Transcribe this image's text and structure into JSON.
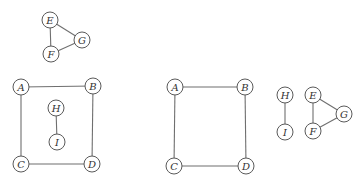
{
  "graphs": [
    {
      "id": "top-triangle",
      "nodes": [
        {
          "label": "E",
          "x": 50,
          "y": 20
        },
        {
          "label": "F",
          "x": 51,
          "y": 54
        },
        {
          "label": "G",
          "x": 82,
          "y": 40
        }
      ],
      "edges": [
        [
          "E",
          "F"
        ],
        [
          "E",
          "G"
        ],
        [
          "F",
          "G"
        ]
      ]
    },
    {
      "id": "left-square-with-HI",
      "nodes": [
        {
          "label": "A",
          "x": 21,
          "y": 87
        },
        {
          "label": "B",
          "x": 93,
          "y": 86
        },
        {
          "label": "C",
          "x": 21,
          "y": 164
        },
        {
          "label": "D",
          "x": 92,
          "y": 164
        },
        {
          "label": "H",
          "x": 56,
          "y": 108
        },
        {
          "label": "I",
          "x": 57,
          "y": 142
        }
      ],
      "edges": [
        [
          "A",
          "B"
        ],
        [
          "A",
          "C"
        ],
        [
          "B",
          "D"
        ],
        [
          "C",
          "D"
        ],
        [
          "H",
          "I"
        ]
      ]
    },
    {
      "id": "middle-square",
      "nodes": [
        {
          "label": "A",
          "x": 175,
          "y": 87
        },
        {
          "label": "B",
          "x": 245,
          "y": 87
        },
        {
          "label": "C",
          "x": 174,
          "y": 166
        },
        {
          "label": "D",
          "x": 246,
          "y": 166
        }
      ],
      "edges": [
        [
          "A",
          "B"
        ],
        [
          "A",
          "C"
        ],
        [
          "B",
          "D"
        ],
        [
          "C",
          "D"
        ]
      ]
    },
    {
      "id": "right-HI",
      "nodes": [
        {
          "label": "H",
          "x": 285,
          "y": 95
        },
        {
          "label": "I",
          "x": 285,
          "y": 132
        }
      ],
      "edges": [
        [
          "H",
          "I"
        ]
      ]
    },
    {
      "id": "right-triangle",
      "nodes": [
        {
          "label": "E",
          "x": 313,
          "y": 95
        },
        {
          "label": "F",
          "x": 313,
          "y": 131
        },
        {
          "label": "G",
          "x": 344,
          "y": 114
        }
      ],
      "edges": [
        [
          "E",
          "F"
        ],
        [
          "E",
          "G"
        ],
        [
          "F",
          "G"
        ]
      ]
    }
  ],
  "style": {
    "node_radius": 8,
    "edge_color": "#6f6f6f",
    "node_stroke": "#5a5a5a"
  }
}
